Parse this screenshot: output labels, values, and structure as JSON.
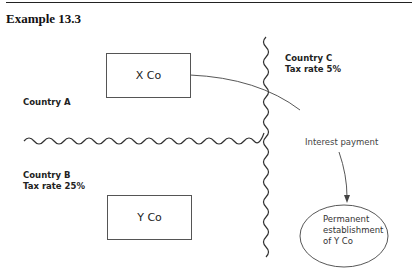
{
  "header": {
    "title": "Example 13.3"
  },
  "countries": {
    "a": {
      "name": "Country A"
    },
    "b": {
      "name": "Country B",
      "tax": "Tax rate 25%"
    },
    "c": {
      "name": "Country C",
      "tax": "Tax rate 5%"
    }
  },
  "entities": {
    "x_co": "X Co",
    "y_co": "Y Co",
    "pe": {
      "line1": "Permanent",
      "line2": "establishment",
      "line3": "of Y Co"
    }
  },
  "flows": {
    "interest": "Interest payment"
  },
  "colors": {
    "line": "#333333",
    "text": "#222222"
  }
}
